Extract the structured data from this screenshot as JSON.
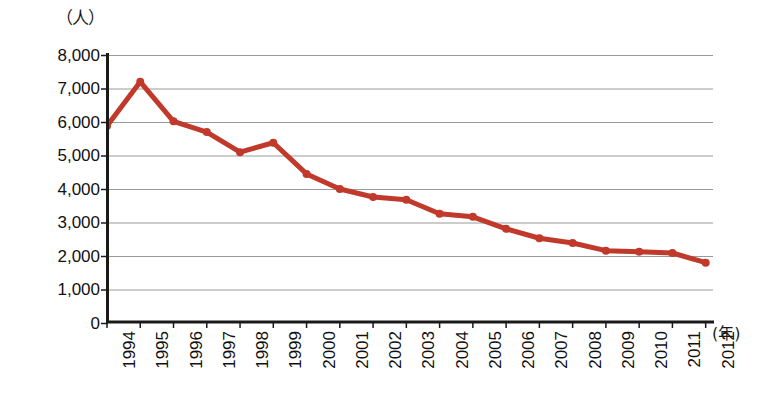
{
  "chart_data": {
    "type": "line",
    "title": "",
    "subtitle": "",
    "xlabel": "(年)",
    "ylabel": "（人）",
    "y_unit_caption": "（人）",
    "x_unit_caption": "(年)",
    "categories": [
      "1994",
      "1995",
      "1996",
      "1997",
      "1998",
      "1999",
      "2000",
      "2001",
      "2002",
      "2003",
      "2004",
      "2005",
      "2006",
      "2007",
      "2008",
      "2009",
      "2010",
      "2011",
      "2012"
    ],
    "values": [
      5880,
      7200,
      6020,
      5700,
      5100,
      5380,
      4450,
      4000,
      3760,
      3680,
      3260,
      3170,
      2810,
      2530,
      2390,
      2160,
      2130,
      2090,
      1800
    ],
    "series": [
      {
        "name": "人数",
        "values": [
          5880,
          7200,
          6020,
          5700,
          5100,
          5380,
          4450,
          4000,
          3760,
          3680,
          3260,
          3170,
          2810,
          2530,
          2390,
          2160,
          2130,
          2090,
          1800
        ],
        "color": "#C0392B",
        "marker": "circle"
      }
    ],
    "ylim": [
      0,
      8000
    ],
    "ytick_values": [
      8000,
      7000,
      6000,
      5000,
      4000,
      3000,
      2000,
      1000,
      0
    ],
    "ytick_labels": [
      "8,000",
      "7,000",
      "6,000",
      "5,000",
      "4,000",
      "3,000",
      "2,000",
      "1,000",
      "0"
    ],
    "grid": "horizontal",
    "gridline_color": "#9a9a9a",
    "axis_color": "#1a1a1a",
    "legend": "none",
    "legend_position": "none",
    "background_color": "#ffffff",
    "line_color": "#C0392B",
    "line_width_px": 5,
    "marker_radius_px": 4
  }
}
